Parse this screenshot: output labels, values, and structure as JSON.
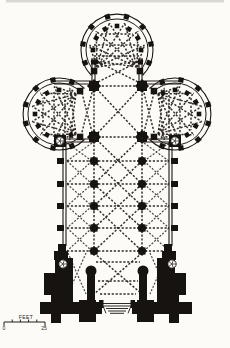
{
  "figure": {
    "kind": "architectural-floor-plan",
    "ink_color": "#171310",
    "paper_color": "#fcfbf8"
  },
  "scale_bar": {
    "unit_label": "FEET",
    "start_label": "0",
    "end_label": "25"
  }
}
